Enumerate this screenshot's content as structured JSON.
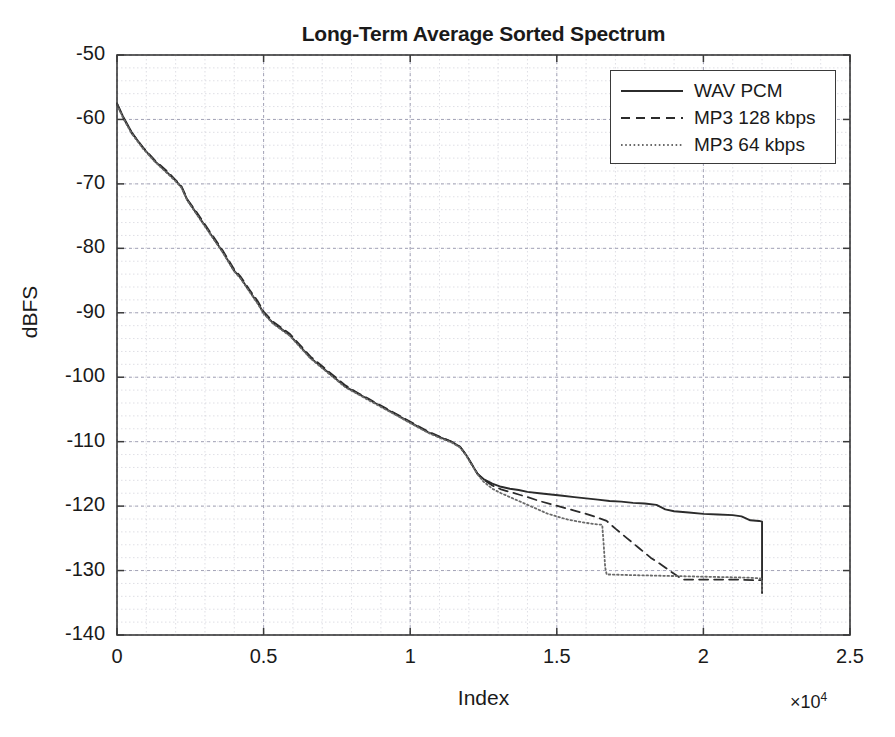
{
  "chart_data": {
    "type": "line",
    "title": "Long-Term Average Sorted Spectrum",
    "xlabel": "Index",
    "ylabel": "dBFS",
    "x_exponent_label": "×10",
    "x_exponent_power": "4",
    "x_multiplier": 10000,
    "xlim": [
      0,
      2.5
    ],
    "ylim": [
      -140,
      -50
    ],
    "xticks": [
      "0",
      "0.5",
      "1",
      "1.5",
      "2",
      "2.5"
    ],
    "xtick_values": [
      0,
      0.5,
      1,
      1.5,
      2,
      2.5
    ],
    "yticks": [
      "-50",
      "-60",
      "-70",
      "-80",
      "-90",
      "-100",
      "-110",
      "-120",
      "-130",
      "-140"
    ],
    "ytick_values": [
      -50,
      -60,
      -70,
      -80,
      -90,
      -100,
      -110,
      -120,
      -130,
      -140
    ],
    "grid": true,
    "minor_grid": true,
    "x_minor_step": 0.1,
    "y_minor_step": 2,
    "legend_position": "top-right",
    "series": [
      {
        "name": "WAV PCM",
        "style": "solid",
        "color": "#2b2b2b",
        "x": [
          0,
          0.02,
          0.05,
          0.09,
          0.13,
          0.17,
          0.2,
          0.22,
          0.24,
          0.27,
          0.3,
          0.33,
          0.36,
          0.38,
          0.4,
          0.42,
          0.45,
          0.48,
          0.5,
          0.53,
          0.56,
          0.59,
          0.61,
          0.63,
          0.66,
          0.7,
          0.74,
          0.78,
          0.82,
          0.86,
          0.9,
          0.94,
          0.98,
          1.02,
          1.06,
          1.1,
          1.14,
          1.17,
          1.19,
          1.21,
          1.23,
          1.25,
          1.28,
          1.31,
          1.34,
          1.37,
          1.4,
          1.44,
          1.48,
          1.52,
          1.56,
          1.6,
          1.64,
          1.68,
          1.72,
          1.76,
          1.8,
          1.84,
          1.87,
          1.9,
          1.95,
          2.0,
          2.05,
          2.1,
          2.13,
          2.16,
          2.19,
          2.2,
          2.2,
          2.2
        ],
        "y": [
          -57.5,
          -59.5,
          -62.0,
          -64.5,
          -66.5,
          -68.2,
          -69.5,
          -70.5,
          -72.5,
          -74.5,
          -76.5,
          -78.5,
          -80.5,
          -82.0,
          -83.5,
          -84.5,
          -86.5,
          -88.5,
          -90.0,
          -91.5,
          -92.5,
          -93.5,
          -94.5,
          -95.5,
          -97.0,
          -98.5,
          -100.0,
          -101.5,
          -102.5,
          -103.5,
          -104.5,
          -105.5,
          -106.5,
          -107.5,
          -108.5,
          -109.3,
          -110.0,
          -110.8,
          -112.0,
          -113.5,
          -115.0,
          -115.8,
          -116.5,
          -117.0,
          -117.3,
          -117.5,
          -117.8,
          -118.0,
          -118.2,
          -118.4,
          -118.6,
          -118.8,
          -119.0,
          -119.2,
          -119.3,
          -119.5,
          -119.6,
          -119.8,
          -120.5,
          -120.8,
          -121.0,
          -121.2,
          -121.3,
          -121.4,
          -121.6,
          -122.2,
          -122.3,
          -122.4,
          -128.0,
          -133.5
        ]
      },
      {
        "name": "MP3 128 kbps",
        "style": "dashed",
        "color": "#2b2b2b",
        "x": [
          0,
          0.02,
          0.05,
          0.09,
          0.13,
          0.17,
          0.2,
          0.22,
          0.24,
          0.27,
          0.3,
          0.33,
          0.36,
          0.38,
          0.4,
          0.42,
          0.45,
          0.48,
          0.5,
          0.53,
          0.56,
          0.59,
          0.61,
          0.63,
          0.66,
          0.7,
          0.74,
          0.78,
          0.82,
          0.86,
          0.9,
          0.94,
          0.98,
          1.02,
          1.06,
          1.1,
          1.14,
          1.17,
          1.19,
          1.21,
          1.23,
          1.25,
          1.28,
          1.31,
          1.34,
          1.37,
          1.4,
          1.44,
          1.48,
          1.52,
          1.56,
          1.6,
          1.64,
          1.67,
          1.7,
          1.74,
          1.78,
          1.82,
          1.86,
          1.89,
          1.91,
          1.92,
          1.925,
          1.93,
          1.98,
          2.05,
          2.12,
          2.18,
          2.2
        ],
        "y": [
          -57.6,
          -59.6,
          -62.1,
          -64.4,
          -66.4,
          -68.0,
          -69.4,
          -70.4,
          -72.4,
          -74.3,
          -76.3,
          -78.3,
          -80.3,
          -81.8,
          -83.3,
          -84.3,
          -86.3,
          -88.2,
          -89.8,
          -91.3,
          -92.3,
          -93.3,
          -94.3,
          -95.3,
          -96.8,
          -98.3,
          -99.8,
          -101.3,
          -102.4,
          -103.4,
          -104.4,
          -105.4,
          -106.4,
          -107.4,
          -108.4,
          -109.2,
          -110.0,
          -110.8,
          -112.0,
          -113.5,
          -115.0,
          -115.9,
          -116.8,
          -117.4,
          -117.8,
          -118.2,
          -118.6,
          -119.2,
          -119.7,
          -120.2,
          -120.7,
          -121.2,
          -121.8,
          -122.3,
          -123.5,
          -125.0,
          -126.5,
          -128.0,
          -129.2,
          -130.2,
          -130.8,
          -131.1,
          -131.3,
          -131.4,
          -131.4,
          -131.4,
          -131.4,
          -131.5,
          -131.5
        ]
      },
      {
        "name": "MP3 64 kbps",
        "style": "dotted",
        "color": "#6a6a6a",
        "x": [
          0,
          0.02,
          0.05,
          0.09,
          0.13,
          0.17,
          0.2,
          0.22,
          0.24,
          0.27,
          0.3,
          0.33,
          0.36,
          0.38,
          0.4,
          0.42,
          0.45,
          0.48,
          0.5,
          0.53,
          0.56,
          0.59,
          0.61,
          0.63,
          0.66,
          0.7,
          0.74,
          0.78,
          0.82,
          0.86,
          0.9,
          0.94,
          0.98,
          1.02,
          1.06,
          1.1,
          1.14,
          1.17,
          1.19,
          1.21,
          1.23,
          1.25,
          1.28,
          1.31,
          1.34,
          1.37,
          1.4,
          1.44,
          1.47,
          1.5,
          1.53,
          1.56,
          1.6,
          1.63,
          1.655,
          1.66,
          1.665,
          1.67,
          1.75,
          1.85,
          1.95,
          2.05,
          2.15,
          2.19,
          2.2,
          2.2
        ],
        "y": [
          -57.7,
          -59.7,
          -62.2,
          -64.6,
          -66.6,
          -68.3,
          -69.6,
          -70.6,
          -72.6,
          -74.6,
          -76.6,
          -78.6,
          -80.6,
          -82.1,
          -83.6,
          -84.6,
          -86.6,
          -88.6,
          -90.1,
          -91.6,
          -92.6,
          -93.6,
          -94.6,
          -95.6,
          -97.1,
          -98.6,
          -100.1,
          -101.6,
          -102.6,
          -103.6,
          -104.6,
          -105.6,
          -106.6,
          -107.6,
          -108.6,
          -109.4,
          -110.1,
          -110.9,
          -112.1,
          -113.6,
          -115.1,
          -116.2,
          -117.3,
          -118.0,
          -118.6,
          -119.2,
          -119.8,
          -120.6,
          -121.2,
          -121.6,
          -122.0,
          -122.3,
          -122.6,
          -122.8,
          -122.9,
          -126.0,
          -129.5,
          -130.6,
          -130.7,
          -130.8,
          -130.9,
          -131.0,
          -131.1,
          -131.2,
          -131.3,
          -133.5
        ]
      }
    ]
  },
  "axes": {
    "plot_left_px": 117,
    "plot_top_px": 55,
    "plot_right_px": 850,
    "plot_bottom_px": 635
  }
}
